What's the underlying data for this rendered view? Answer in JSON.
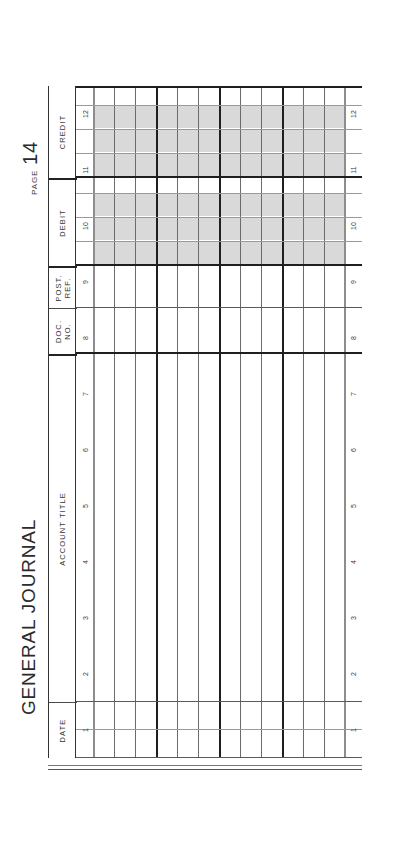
{
  "document": {
    "title": "GENERAL JOURNAL",
    "page_label": "PAGE",
    "page_number": "14",
    "form_type": "accounting-ledger-sheet",
    "orientation": "rotated-90-ccw"
  },
  "colors": {
    "paper": "#ffffff",
    "rule_dark": "#1f1f1f",
    "rule_medium": "#5a5a5a",
    "rule_light": "#9a9a9a",
    "shade": "#d9d9d9",
    "text": "#2b2b2b"
  },
  "table": {
    "columns": [
      {
        "key": "date",
        "label": "DATE",
        "subcells": 2,
        "money": false
      },
      {
        "key": "account_title",
        "label": "ACCOUNT TITLE",
        "subcells": 1,
        "money": false
      },
      {
        "key": "doc_no",
        "label": "DOC.\nNO.",
        "subcells": 1,
        "money": false
      },
      {
        "key": "post_ref",
        "label": "POST.\nREF.",
        "subcells": 1,
        "money": false
      },
      {
        "key": "debit",
        "label": "DEBIT",
        "subcells": 4,
        "money": true
      },
      {
        "key": "credit",
        "label": "CREDIT",
        "subcells": 4,
        "money": true
      }
    ],
    "row_numbers": [
      "1",
      "2",
      "3",
      "4",
      "5",
      "6",
      "7",
      "8",
      "9",
      "10",
      "11",
      "12"
    ],
    "row_count": 12,
    "rows": [
      {
        "n": "1",
        "date": "",
        "account_title": "",
        "doc_no": "",
        "post_ref": "",
        "debit": "",
        "credit": ""
      },
      {
        "n": "2",
        "date": "",
        "account_title": "",
        "doc_no": "",
        "post_ref": "",
        "debit": "",
        "credit": ""
      },
      {
        "n": "3",
        "date": "",
        "account_title": "",
        "doc_no": "",
        "post_ref": "",
        "debit": "",
        "credit": ""
      },
      {
        "n": "4",
        "date": "",
        "account_title": "",
        "doc_no": "",
        "post_ref": "",
        "debit": "",
        "credit": ""
      },
      {
        "n": "5",
        "date": "",
        "account_title": "",
        "doc_no": "",
        "post_ref": "",
        "debit": "",
        "credit": ""
      },
      {
        "n": "6",
        "date": "",
        "account_title": "",
        "doc_no": "",
        "post_ref": "",
        "debit": "",
        "credit": ""
      },
      {
        "n": "7",
        "date": "",
        "account_title": "",
        "doc_no": "",
        "post_ref": "",
        "debit": "",
        "credit": ""
      },
      {
        "n": "8",
        "date": "",
        "account_title": "",
        "doc_no": "",
        "post_ref": "",
        "debit": "",
        "credit": ""
      },
      {
        "n": "9",
        "date": "",
        "account_title": "",
        "doc_no": "",
        "post_ref": "",
        "debit": "",
        "credit": ""
      },
      {
        "n": "10",
        "date": "",
        "account_title": "",
        "doc_no": "",
        "post_ref": "",
        "debit": "",
        "credit": ""
      },
      {
        "n": "11",
        "date": "",
        "account_title": "",
        "doc_no": "",
        "post_ref": "",
        "debit": "",
        "credit": ""
      },
      {
        "n": "12",
        "date": "",
        "account_title": "",
        "doc_no": "",
        "post_ref": "",
        "debit": "",
        "credit": ""
      }
    ]
  }
}
